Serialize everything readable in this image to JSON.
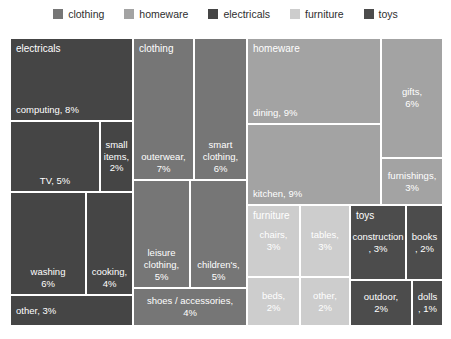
{
  "chart_data": {
    "type": "treemap",
    "title": "",
    "unit": "% of total",
    "legend_position": "top",
    "legend": [
      {
        "label": "clothing",
        "color": "#767676"
      },
      {
        "label": "homeware",
        "color": "#a3a3a3"
      },
      {
        "label": "electricals",
        "color": "#454545"
      },
      {
        "label": "furniture",
        "color": "#cdcdcd"
      },
      {
        "label": "toys",
        "color": "#4c4c4c"
      }
    ],
    "groups": [
      {
        "name": "electricals",
        "color": "#454545",
        "total": 28,
        "cells": [
          {
            "id": "computing",
            "label": "computing",
            "value": 8,
            "lines": [
              "computing, 8%"
            ],
            "rect": [
              0,
              0,
              123,
              83
            ],
            "align": "bl",
            "header": true
          },
          {
            "id": "tv",
            "label": "TV",
            "value": 5,
            "lines": [
              "TV, 5%"
            ],
            "rect": [
              0,
              83,
              90,
              71
            ],
            "align": "bc"
          },
          {
            "id": "small-items",
            "label": "small items",
            "value": 2,
            "lines": [
              "small",
              "items,",
              "2%"
            ],
            "rect": [
              90,
              83,
              33,
              71
            ],
            "align": "c"
          },
          {
            "id": "washing",
            "label": "washing",
            "value": 6,
            "lines": [
              "washing",
              "6%"
            ],
            "rect": [
              0,
              154,
              76,
              103
            ],
            "align": "bc"
          },
          {
            "id": "cooking",
            "label": "cooking",
            "value": 4,
            "lines": [
              "cooking,",
              "4%"
            ],
            "rect": [
              76,
              154,
              47,
              103
            ],
            "align": "bc"
          },
          {
            "id": "other-electricals",
            "label": "other",
            "value": 3,
            "lines": [
              "other, 3%"
            ],
            "rect": [
              0,
              257,
              123,
              31
            ],
            "align": "cl"
          }
        ]
      },
      {
        "name": "clothing",
        "color": "#767676",
        "total": 27,
        "cells": [
          {
            "id": "outerwear",
            "label": "outerwear",
            "value": 7,
            "lines": [
              "outerwear,",
              "7%"
            ],
            "rect": [
              123,
              0,
              61,
              142
            ],
            "align": "bc",
            "header": true
          },
          {
            "id": "smart-clothing",
            "label": "smart clothing",
            "value": 6,
            "lines": [
              "smart",
              "clothing,",
              "6%"
            ],
            "rect": [
              184,
              0,
              53,
              142
            ],
            "align": "bc"
          },
          {
            "id": "leisure-clothing",
            "label": "leisure clothing",
            "value": 5,
            "lines": [
              "leisure",
              "clothing,",
              "5%"
            ],
            "rect": [
              123,
              142,
              57,
              108
            ],
            "align": "bc"
          },
          {
            "id": "childrens",
            "label": "children's",
            "value": 5,
            "lines": [
              "children's,",
              "5%"
            ],
            "rect": [
              180,
              142,
              57,
              108
            ],
            "align": "bc"
          },
          {
            "id": "shoes-accessories",
            "label": "shoes / accessories",
            "value": 4,
            "lines": [
              "shoes / accessories,",
              "4%"
            ],
            "rect": [
              123,
              250,
              114,
              38
            ],
            "align": "c"
          }
        ]
      },
      {
        "name": "homeware",
        "color": "#a3a3a3",
        "total": 27,
        "cells": [
          {
            "id": "dining",
            "label": "dining",
            "value": 9,
            "lines": [
              "dining, 9%"
            ],
            "rect": [
              237,
              0,
              134,
              86
            ],
            "align": "bl",
            "header": true
          },
          {
            "id": "kitchen",
            "label": "kitchen",
            "value": 9,
            "lines": [
              "kitchen, 9%"
            ],
            "rect": [
              237,
              86,
              134,
              81
            ],
            "align": "bl"
          },
          {
            "id": "gifts",
            "label": "gifts",
            "value": 6,
            "lines": [
              "gifts,",
              "6%"
            ],
            "rect": [
              371,
              0,
              62,
              120
            ],
            "align": "c"
          },
          {
            "id": "furnishings",
            "label": "furnishings",
            "value": 3,
            "lines": [
              "furnishings,",
              "3%"
            ],
            "rect": [
              371,
              120,
              62,
              47
            ],
            "align": "c"
          }
        ]
      },
      {
        "name": "furniture",
        "color": "#cdcdcd",
        "total": 10,
        "cells": [
          {
            "id": "chairs",
            "label": "chairs",
            "value": 3,
            "lines": [
              "chairs,",
              "3%"
            ],
            "rect": [
              237,
              167,
              53,
              72
            ],
            "align": "c",
            "header": true
          },
          {
            "id": "tables",
            "label": "tables",
            "value": 3,
            "lines": [
              "tables,",
              "3%"
            ],
            "rect": [
              290,
              167,
              50,
              72
            ],
            "align": "c"
          },
          {
            "id": "beds",
            "label": "beds",
            "value": 2,
            "lines": [
              "beds,",
              "2%"
            ],
            "rect": [
              237,
              239,
              53,
              49
            ],
            "align": "c"
          },
          {
            "id": "other-furniture",
            "label": "other",
            "value": 2,
            "lines": [
              "other,",
              "2%"
            ],
            "rect": [
              290,
              239,
              50,
              49
            ],
            "align": "c"
          }
        ]
      },
      {
        "name": "toys",
        "color": "#4c4c4c",
        "total": 8,
        "cells": [
          {
            "id": "construction",
            "label": "construction",
            "value": 3,
            "lines": [
              "construction",
              ", 3%"
            ],
            "rect": [
              340,
              167,
              56,
              75
            ],
            "align": "c",
            "header": true
          },
          {
            "id": "books",
            "label": "books",
            "value": 2,
            "lines": [
              "books",
              ", 2%"
            ],
            "rect": [
              396,
              167,
              37,
              75
            ],
            "align": "c"
          },
          {
            "id": "outdoor",
            "label": "outdoor",
            "value": 2,
            "lines": [
              "outdoor,",
              "2%"
            ],
            "rect": [
              340,
              242,
              62,
              46
            ],
            "align": "c"
          },
          {
            "id": "dolls",
            "label": "dolls",
            "value": 1,
            "lines": [
              "dolls",
              ", 1%"
            ],
            "rect": [
              402,
              242,
              31,
              46
            ],
            "align": "c"
          }
        ]
      }
    ]
  }
}
